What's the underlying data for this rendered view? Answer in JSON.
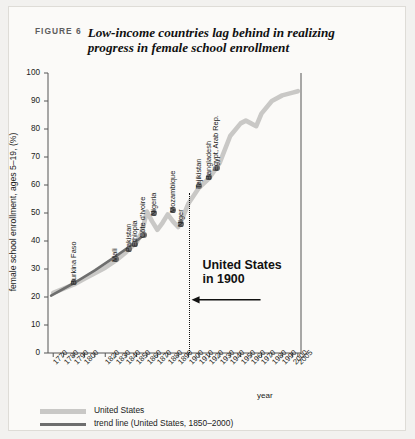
{
  "figure": {
    "label": "FIGURE 6",
    "title": "Low-income countries lag behind in realizing progress in female school enrollment",
    "border_color": "#dedcd7",
    "background": "#fbfaf8"
  },
  "annotation": {
    "line1": "United States",
    "line2": "in 1900",
    "at_year": 1900
  },
  "legend": {
    "items": [
      {
        "label": "United States",
        "color": "#c9c8c6",
        "style": "thick-line"
      },
      {
        "label": "trend line (United States, 1850–2000)",
        "color": "#6e6e6e",
        "style": "line"
      }
    ]
  },
  "chart_data": {
    "type": "line",
    "title": "Low-income countries lag behind in realizing progress in female school enrollment",
    "xlabel": "year",
    "ylabel": "female school enrollment, ages 5–19, (%)",
    "xlim": [
      1765,
      2008
    ],
    "ylim": [
      0,
      100
    ],
    "yticks": [
      0,
      10,
      20,
      30,
      40,
      50,
      60,
      70,
      80,
      90,
      100
    ],
    "xticks": [
      1770,
      1780,
      1790,
      1800,
      1810,
      1820,
      1830,
      1840,
      1850,
      1860,
      1870,
      1880,
      1890,
      1900,
      1910,
      1920,
      1930,
      1940,
      1950,
      1960,
      1970,
      1980,
      1990,
      2000,
      2005
    ],
    "xtick_labels": [
      "1770",
      "1780",
      "1790",
      "1800",
      "",
      "1820",
      "1830",
      "1840",
      "1850",
      "1860",
      "1870",
      "1880",
      "1890",
      "1900",
      "1910",
      "1920",
      "1930",
      "1940",
      "1950",
      "1960",
      "1970",
      "1980",
      "1990",
      "2000",
      "2005"
    ],
    "grid": false,
    "legend_position": "bottom-left",
    "series": [
      {
        "name": "United States",
        "color": "#c9c8c6",
        "x": [
          1770,
          1790,
          1800,
          1810,
          1820,
          1830,
          1840,
          1850,
          1855,
          1860,
          1865,
          1870,
          1875,
          1880,
          1885,
          1890,
          1895,
          1900,
          1910,
          1920,
          1930,
          1940,
          1950,
          1955,
          1960,
          1965,
          1970,
          1980,
          1990,
          2000,
          2005
        ],
        "y": [
          21.5,
          24.5,
          26.5,
          28.5,
          30.5,
          33.0,
          36.0,
          39.5,
          43.0,
          50.5,
          47.0,
          44.0,
          46.5,
          49.5,
          47.0,
          45.0,
          49.0,
          53.5,
          59.0,
          62.5,
          68.0,
          77.5,
          82.0,
          83.0,
          82.0,
          81.0,
          85.5,
          90.0,
          92.0,
          93.0,
          93.5
        ]
      },
      {
        "name": "trend line (United States, 1850–2000)",
        "color": "#6e6e6e",
        "x": [
          1768,
          1790,
          1810,
          1830,
          1845,
          1855
        ],
        "y": [
          20.5,
          25.0,
          29.5,
          34.5,
          38.5,
          41.5
        ]
      }
    ],
    "country_points": [
      {
        "name": "Burkina Faso",
        "year": 1790,
        "value": 25.5
      },
      {
        "name": "Mali",
        "year": 1830,
        "value": 33.5
      },
      {
        "name": "Pakistan",
        "year": 1843,
        "value": 37.0
      },
      {
        "name": "Ethiopia",
        "year": 1849,
        "value": 39.0
      },
      {
        "name": "Côte d'Ivoire",
        "year": 1857,
        "value": 42.0
      },
      {
        "name": "Nigeria",
        "year": 1867,
        "value": 50.0
      },
      {
        "name": "Mozambique",
        "year": 1885,
        "value": 51.0
      },
      {
        "name": "Niger",
        "year": 1893,
        "value": 46.0
      },
      {
        "name": "Tajikistan",
        "year": 1910,
        "value": 59.5
      },
      {
        "name": "Bangladesh",
        "year": 1920,
        "value": 63.0
      },
      {
        "name": "Egypt, Arab Rep.",
        "year": 1927,
        "value": 66.0
      }
    ]
  }
}
